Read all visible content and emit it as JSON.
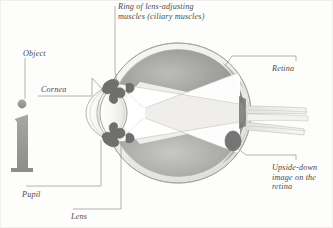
{
  "figure": {
    "background_color": "#fdfdfc",
    "ink_color": "#4a4a4a",
    "line_color": "#9a9a96"
  },
  "labels": {
    "ciliary": "Ring of lens-adjusting\nmuscles (ciliary muscles)",
    "object": "Object",
    "cornea": "Cornea",
    "pupil": "Pupil",
    "lens": "Lens",
    "retina": "Retina",
    "upside_down": "Upside-down\nimage on the\nretina"
  },
  "parts": {
    "object_glyph": "i",
    "sclera": "sclera-outer-coat",
    "choroid": "choroid-dark-interior",
    "retina_layer": "retina-inner-lining",
    "lens_body": "crystalline-lens",
    "cornea_dome": "cornea",
    "ciliary_upper": "ciliary-muscle-upper",
    "ciliary_lower": "ciliary-muscle-lower",
    "optic_nerve": "optic-nerve-bundle",
    "light_cone_upper": "light-ray-cone-upper",
    "light_cone_lower": "light-ray-cone-lower",
    "inverted_image": "inverted-image-spot"
  },
  "colors": {
    "sclera_light": "#f2f1ef",
    "sclera_shade": "#d9d8d4",
    "choroid_dark": "#8e8e8c",
    "choroid_mid": "#a9a9a6",
    "choroid_light": "#c6c6c2",
    "lens_fill": "#f7f7f5",
    "ray_fill": "#ffffff",
    "muscle_dark": "#6e6e6c",
    "nerve": "#e6e5e2"
  }
}
